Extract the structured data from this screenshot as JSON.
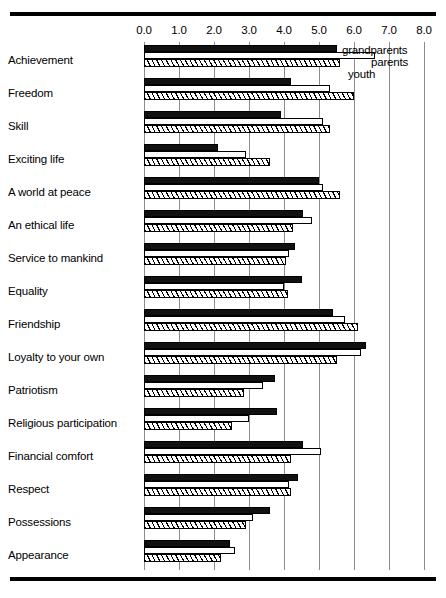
{
  "chart_data": {
    "type": "bar",
    "orientation": "horizontal",
    "title": "",
    "xlabel": "",
    "ylabel": "",
    "xlim": [
      0.0,
      8.0
    ],
    "xticks": [
      "0.0",
      "1.0",
      "2.0",
      "3.0",
      "4.0",
      "5.0",
      "6.0",
      "7.0",
      "8.0"
    ],
    "xtick_values": [
      0.0,
      1.0,
      2.0,
      3.0,
      4.0,
      5.0,
      6.0,
      7.0,
      8.0
    ],
    "grid": true,
    "legend_position": "top-right-inline",
    "categories": [
      "Achievement",
      "Freedom",
      "Skill",
      "Exciting life",
      "A world at peace",
      "An ethical life",
      "Service to mankind",
      "Equality",
      "Friendship",
      "Loyalty to your own",
      "Patriotism",
      "Religious participation",
      "Financial comfort",
      "Respect",
      "Possessions",
      "Appearance"
    ],
    "series": [
      {
        "name": "grandparents",
        "style": "solid-black",
        "color": "#111111",
        "values": [
          5.5,
          4.2,
          3.9,
          2.1,
          5.0,
          4.55,
          4.3,
          4.5,
          5.4,
          6.35,
          3.75,
          3.8,
          4.55,
          4.4,
          3.6,
          2.45
        ]
      },
      {
        "name": "parents",
        "style": "open-outline",
        "color": "#ffffff",
        "values": [
          6.6,
          5.3,
          5.1,
          2.9,
          5.1,
          4.8,
          4.15,
          4.0,
          5.75,
          6.2,
          3.4,
          3.0,
          5.05,
          4.15,
          3.1,
          2.6
        ]
      },
      {
        "name": "youth",
        "style": "hatched",
        "color": "#ffffff",
        "values": [
          5.6,
          6.0,
          5.3,
          3.6,
          5.6,
          4.25,
          4.05,
          4.1,
          6.1,
          5.5,
          2.85,
          2.5,
          4.2,
          4.2,
          2.9,
          2.2
        ]
      }
    ]
  },
  "legend": {
    "grandparents": "grandparents",
    "parents": "parents",
    "youth": "youth"
  }
}
